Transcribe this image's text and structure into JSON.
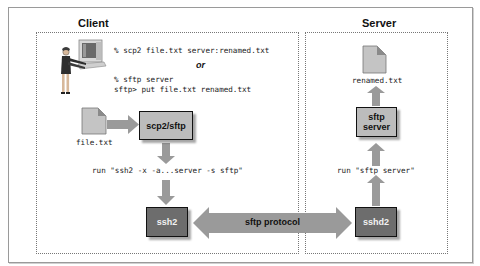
{
  "diagram": {
    "client": {
      "title": "Client",
      "command_scp2": "% scp2 file.txt server:renamed.txt",
      "or_label": "or",
      "command_sftp_line1": "% sftp server",
      "command_sftp_line2": "sftp> put file.txt renamed.txt",
      "file_label": "file.txt",
      "scp2_box_label": "scp2/sftp",
      "run_label": "run \"ssh2 -x -a...server -s sftp\"",
      "ssh2_box_label": "ssh2"
    },
    "server": {
      "title": "Server",
      "file_label": "renamed.txt",
      "sftp_server_line1": "sftp",
      "sftp_server_line2": "server",
      "run_label": "run \"sftp server\"",
      "sshd2_box_label": "sshd2"
    },
    "protocol_label": "sftp protocol",
    "colors": {
      "light_box": "#bcbcbc",
      "dark_box": "#6d6d6d",
      "arrow": "#9a9a9a",
      "file_icon": "#c4c4c4"
    }
  }
}
